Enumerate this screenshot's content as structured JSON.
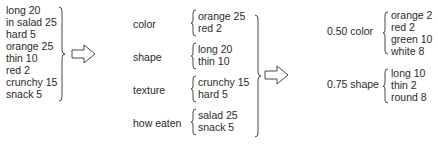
{
  "stage1": {
    "items": [
      "long 20",
      "in salad 25",
      "hard 5",
      "orange 25",
      "thin 10",
      "red 2",
      "crunchy 15",
      "snack 5"
    ]
  },
  "stage2": {
    "groups": [
      {
        "label": "color",
        "items": [
          "orange 25",
          "red 2"
        ]
      },
      {
        "label": "shape",
        "items": [
          "long 20",
          "thin 10"
        ]
      },
      {
        "label": "texture",
        "items": [
          "crunchy 15",
          "hard 5"
        ]
      },
      {
        "label": "how eaten",
        "items": [
          "salad 25",
          "snack 5"
        ]
      }
    ]
  },
  "stage3": {
    "groups": [
      {
        "label": "0.50 color",
        "items": [
          "orange 2",
          "red 2",
          "green 10",
          "white 8"
        ]
      },
      {
        "label": "0.75 shape",
        "items": [
          "long 10",
          "thin 2",
          "round 8"
        ]
      }
    ]
  },
  "arrows": [
    "right-arrow",
    "right-arrow"
  ]
}
